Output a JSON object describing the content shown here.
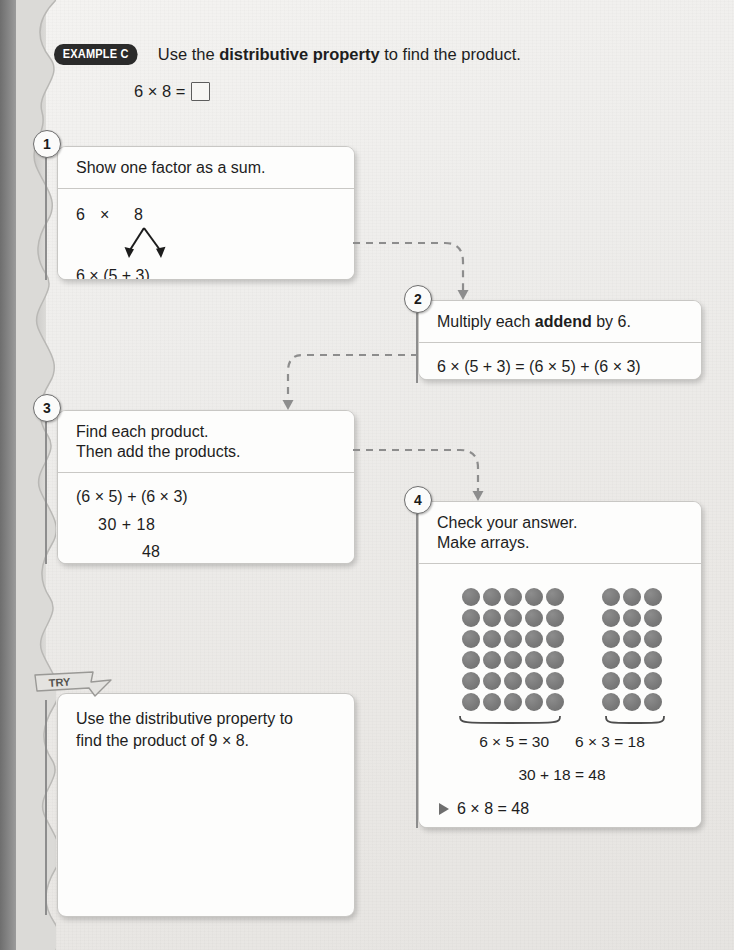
{
  "header": {
    "badge": "EXAMPLE C",
    "instruction_pre": "Use the ",
    "instruction_bold": "distributive property",
    "instruction_post": " to find the product.",
    "equation": "6 × 8 =",
    "answer_box": "empty-box"
  },
  "steps": [
    {
      "number": "1",
      "title": "Show one factor as a sum.",
      "line_factor_left": "6",
      "line_factor_times": "×",
      "line_factor_right": "8",
      "line_result": "6 × (5 + 3)"
    },
    {
      "number": "2",
      "title_pre": "Multiply each ",
      "title_bold": "addend",
      "title_post": " by 6.",
      "line_result": "6 × (5 + 3) = (6 × 5) + (6 × 3)"
    },
    {
      "number": "3",
      "title_line1": "Find each product.",
      "title_line2": "Then add the products.",
      "line1": "(6 × 5) + (6 × 3)",
      "line2": "30  +  18",
      "line3": "48"
    },
    {
      "number": "4",
      "title_line1": "Check your answer.",
      "title_line2": "Make arrays.",
      "array_left_label": "6 × 5 = 30",
      "array_right_label": "6 × 3 = 18",
      "sum_line": "30 + 18 = 48",
      "final_line": "6 × 8 = 48"
    }
  ],
  "arrays": {
    "left": {
      "rows": 6,
      "cols": 5,
      "total": 30
    },
    "right": {
      "rows": 6,
      "cols": 3,
      "total": 18
    }
  },
  "try_section": {
    "ribbon_label": "TRY",
    "prompt_line1": "Use the distributive property to",
    "prompt_line2": "find the product of 9 × 8."
  },
  "colors": {
    "page_background": "#eceae8",
    "card_background": "#fdfdfc",
    "card_border": "#c8c7c4",
    "badge_dark": "#2b2b2b",
    "dot_gray": "#7a7a7a",
    "connector_gray": "#8d8d8d",
    "text": "#1e1e1e"
  }
}
